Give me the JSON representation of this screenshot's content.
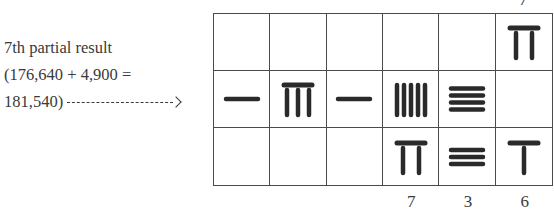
{
  "caption": {
    "line1": "7th partial result",
    "line2": "(176,640 + 4,900 =",
    "line3": "181,540)"
  },
  "top_labels": [
    "",
    "",
    "",
    "",
    "",
    "7"
  ],
  "rows": [
    {
      "name": "multiplier-row",
      "digits": [
        null,
        null,
        null,
        null,
        null,
        7
      ]
    },
    {
      "name": "partial-result-row",
      "digits": [
        1,
        8,
        1,
        5,
        4,
        0
      ]
    },
    {
      "name": "multiplicand-row",
      "digits": [
        null,
        null,
        null,
        7,
        3,
        6
      ]
    }
  ],
  "rod_styles": {
    "row0": "vertical",
    "row1": [
      "horizontal",
      "vertical",
      "horizontal",
      "vertical",
      "horizontal",
      "vertical"
    ],
    "row2": [
      "horizontal",
      "vertical",
      "horizontal",
      "vertical",
      "horizontal",
      "vertical"
    ]
  },
  "bottom_labels": [
    "",
    "",
    "",
    "7",
    "3",
    "6"
  ],
  "colors": {
    "ink": "#2a2a2a",
    "grid": "#4a4a4a",
    "background": "#ffffff"
  }
}
